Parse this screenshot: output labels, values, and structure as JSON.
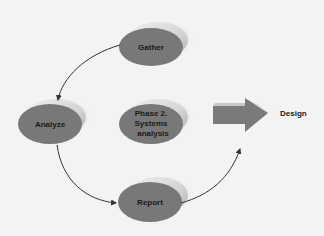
{
  "diagram": {
    "nodes": [
      {
        "id": "gather",
        "label": "Gather"
      },
      {
        "id": "phase2",
        "label_lines": [
          "Phase 2.",
          "Systems",
          "analysis"
        ]
      },
      {
        "id": "analyze",
        "label": "Analyze"
      },
      {
        "id": "report",
        "label": "Report"
      }
    ],
    "edges": [
      {
        "from": "gather",
        "to": "analyze"
      },
      {
        "from": "analyze",
        "to": "report"
      },
      {
        "from": "report",
        "to": "design"
      }
    ],
    "next_phase": {
      "label": "Design"
    },
    "colors": {
      "background": "#f3f3f3",
      "ellipse_fill": "#787878",
      "ellipse_rim": "#d9d9d9",
      "arrow_fill": "#7a7a7a",
      "text": "#1a1a1a",
      "connector": "#333333"
    }
  }
}
